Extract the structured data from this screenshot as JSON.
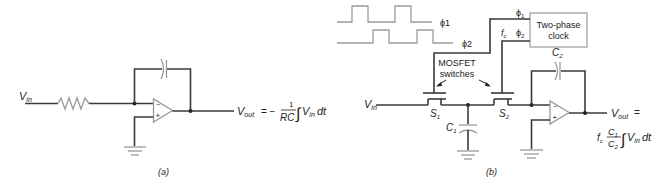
{
  "figure_a": {
    "input_label": "V",
    "input_sub": "in",
    "output_label": "V",
    "output_sub": "out",
    "equation_prefix": "= −",
    "fraction_num": "1",
    "fraction_den": "RC",
    "integral": "∫",
    "integrand": "V",
    "integrand_sub": "in",
    "differential": "dt",
    "opamp_minus": "−",
    "opamp_plus": "+",
    "caption": "(a)"
  },
  "figure_b": {
    "phi1_label": "ϕ1",
    "phi2_label": "ϕ2",
    "clock_phi1": "ϕ",
    "clock_phi1_sub": "1",
    "clock_phi2": "ϕ",
    "clock_phi2_sub": "2",
    "fc_label": "f",
    "fc_sub": "c",
    "clock_box_line1": "Two-phase",
    "clock_box_line2": "clock",
    "mosfet_label_line1": "MOSFET",
    "mosfet_label_line2": "switches",
    "input_label": "V",
    "input_sub": "in",
    "s1_label": "S",
    "s1_sub": "1",
    "s2_label": "S",
    "s2_sub": "2",
    "c1_label": "C",
    "c1_sub": "1",
    "c2_label": "C",
    "c2_sub": "2",
    "output_label": "V",
    "output_sub": "out",
    "output_eq": "=",
    "eq_fc": "f",
    "eq_fc_sub": "c",
    "eq_num": "C",
    "eq_num_sub": "1",
    "eq_den": "C",
    "eq_den_sub": "2",
    "integral": "∫",
    "integrand": "V",
    "integrand_sub": "in",
    "differential": "dt",
    "opamp_minus": "−",
    "opamp_plus": "+",
    "caption": "(b)"
  }
}
